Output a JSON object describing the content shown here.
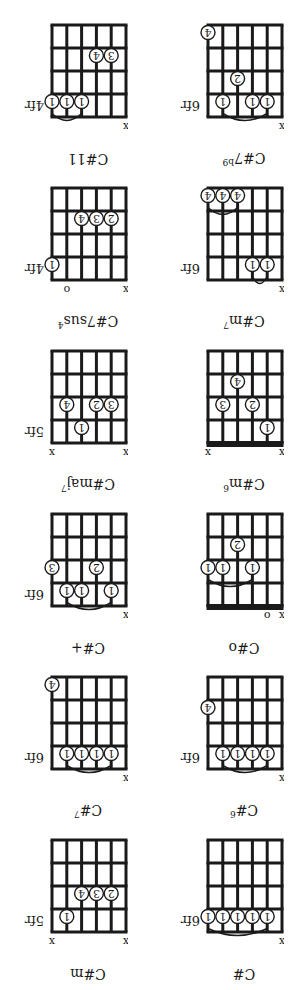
{
  "page": {
    "orientation": "rotated-180",
    "colors": {
      "ink": "#1a1a1a",
      "background": "#ffffff"
    }
  },
  "chords": [
    {
      "name": "C#",
      "suffix": "",
      "fret_label": "6fr",
      "nut": false,
      "markers": [
        "x",
        "",
        "",
        "",
        "",
        ""
      ],
      "dots": [
        {
          "s": 2,
          "f": 1,
          "finger": "1"
        },
        {
          "s": 3,
          "f": 1,
          "finger": "1"
        },
        {
          "s": 4,
          "f": 1,
          "finger": "1"
        },
        {
          "s": 5,
          "f": 1,
          "finger": "1"
        },
        {
          "s": 6,
          "f": 1,
          "finger": "1"
        }
      ],
      "barre": {
        "from": 2,
        "to": 6,
        "f": 1
      }
    },
    {
      "name": "C#m",
      "suffix": "",
      "fret_label": "5fr",
      "nut": false,
      "markers": [
        "x",
        "",
        "",
        "",
        "",
        "x"
      ],
      "dots": [
        {
          "s": 5,
          "f": 1,
          "finger": "1"
        },
        {
          "s": 2,
          "f": 2,
          "finger": "2"
        },
        {
          "s": 3,
          "f": 2,
          "finger": "3"
        },
        {
          "s": 4,
          "f": 2,
          "finger": "4"
        }
      ],
      "barre": null
    },
    {
      "name": "C#",
      "suffix": "6",
      "fret_label": "6fr",
      "nut": false,
      "markers": [
        "x",
        "",
        "",
        "",
        "",
        ""
      ],
      "dots": [
        {
          "s": 2,
          "f": 1,
          "finger": "1"
        },
        {
          "s": 3,
          "f": 1,
          "finger": "1"
        },
        {
          "s": 4,
          "f": 1,
          "finger": "1"
        },
        {
          "s": 5,
          "f": 1,
          "finger": "1"
        },
        {
          "s": 6,
          "f": 3,
          "finger": "4"
        }
      ],
      "barre": {
        "from": 2,
        "to": 5,
        "f": 1
      }
    },
    {
      "name": "C#",
      "suffix": "7",
      "fret_label": "6fr",
      "nut": false,
      "markers": [
        "x",
        "",
        "",
        "",
        "",
        ""
      ],
      "dots": [
        {
          "s": 2,
          "f": 1,
          "finger": "1"
        },
        {
          "s": 3,
          "f": 1,
          "finger": "1"
        },
        {
          "s": 4,
          "f": 1,
          "finger": "1"
        },
        {
          "s": 5,
          "f": 1,
          "finger": "1"
        },
        {
          "s": 6,
          "f": 4,
          "finger": "4"
        }
      ],
      "barre": {
        "from": 2,
        "to": 5,
        "f": 1
      }
    },
    {
      "name": "C#o",
      "suffix": "",
      "fret_label": "",
      "nut": true,
      "markers": [
        "x",
        "o",
        "",
        "",
        "",
        ""
      ],
      "dots": [
        {
          "s": 3,
          "f": 2,
          "finger": "1"
        },
        {
          "s": 5,
          "f": 2,
          "finger": "1"
        },
        {
          "s": 6,
          "f": 2,
          "finger": "1"
        },
        {
          "s": 4,
          "f": 3,
          "finger": "2"
        }
      ],
      "barre": {
        "from": 3,
        "to": 6,
        "f": 2
      }
    },
    {
      "name": "C#+",
      "suffix": "",
      "fret_label": "6fr",
      "nut": false,
      "markers": [
        "x",
        "",
        "",
        "",
        "",
        ""
      ],
      "dots": [
        {
          "s": 2,
          "f": 1,
          "finger": "1"
        },
        {
          "s": 4,
          "f": 1,
          "finger": "1"
        },
        {
          "s": 5,
          "f": 1,
          "finger": "1"
        },
        {
          "s": 3,
          "f": 2,
          "finger": "2"
        },
        {
          "s": 6,
          "f": 2,
          "finger": "3"
        }
      ],
      "barre": {
        "from": 2,
        "to": 5,
        "f": 1
      }
    },
    {
      "name": "C#m",
      "suffix": "6",
      "fret_label": "",
      "nut": true,
      "markers": [
        "x",
        "",
        "",
        "",
        "",
        "x"
      ],
      "dots": [
        {
          "s": 2,
          "f": 1,
          "finger": "1"
        },
        {
          "s": 3,
          "f": 2,
          "finger": "2"
        },
        {
          "s": 5,
          "f": 2,
          "finger": "3"
        },
        {
          "s": 4,
          "f": 3,
          "finger": "4"
        }
      ],
      "barre": null
    },
    {
      "name": "C#maj",
      "suffix": "7",
      "fret_label": "5fr",
      "nut": false,
      "markers": [
        "x",
        "",
        "",
        "",
        "",
        "x"
      ],
      "dots": [
        {
          "s": 4,
          "f": 1,
          "finger": "1"
        },
        {
          "s": 2,
          "f": 2,
          "finger": "3"
        },
        {
          "s": 3,
          "f": 2,
          "finger": "2"
        },
        {
          "s": 5,
          "f": 2,
          "finger": "4"
        }
      ],
      "barre": null
    },
    {
      "name": "C#m",
      "suffix": "7",
      "fret_label": "6fr",
      "nut": false,
      "markers": [
        "x",
        "",
        "",
        "",
        "",
        ""
      ],
      "dots": [
        {
          "s": 2,
          "f": 1,
          "finger": "1"
        },
        {
          "s": 3,
          "f": 1,
          "finger": "1"
        },
        {
          "s": 4,
          "f": 4,
          "finger": "4"
        },
        {
          "s": 5,
          "f": 4,
          "finger": "4"
        },
        {
          "s": 6,
          "f": 4,
          "finger": "4"
        }
      ],
      "barre": {
        "from": 2,
        "to": 3,
        "f": 1
      },
      "barre2": {
        "from": 4,
        "to": 6,
        "f": 4
      }
    },
    {
      "name": "C#7sus",
      "suffix": "4",
      "fret_label": "4fr",
      "nut": false,
      "markers": [
        "x",
        "",
        "",
        "",
        "o",
        ""
      ],
      "dots": [
        {
          "s": 6,
          "f": 1,
          "finger": "1"
        },
        {
          "s": 2,
          "f": 3,
          "finger": "2"
        },
        {
          "s": 3,
          "f": 3,
          "finger": "3"
        },
        {
          "s": 4,
          "f": 3,
          "finger": "4"
        }
      ],
      "barre": null
    },
    {
      "name": "C#7",
      "suffix": "b9",
      "fret_label": "6fr",
      "nut": false,
      "markers": [
        "x",
        "",
        "",
        "",
        "",
        ""
      ],
      "dots": [
        {
          "s": 2,
          "f": 1,
          "finger": "1"
        },
        {
          "s": 3,
          "f": 1,
          "finger": "1"
        },
        {
          "s": 5,
          "f": 1,
          "finger": "1"
        },
        {
          "s": 4,
          "f": 2,
          "finger": "2"
        },
        {
          "s": 6,
          "f": 4,
          "finger": "4"
        }
      ],
      "barre": {
        "from": 2,
        "to": 5,
        "f": 1
      }
    },
    {
      "name": "C#11",
      "suffix": "",
      "fret_label": "4fr",
      "nut": false,
      "markers": [
        "x",
        "",
        "",
        "",
        "",
        ""
      ],
      "dots": [
        {
          "s": 4,
          "f": 1,
          "finger": "1"
        },
        {
          "s": 5,
          "f": 1,
          "finger": "1"
        },
        {
          "s": 6,
          "f": 1,
          "finger": "1"
        },
        {
          "s": 2,
          "f": 3,
          "finger": "3"
        },
        {
          "s": 3,
          "f": 3,
          "finger": "4"
        }
      ],
      "barre": {
        "from": 4,
        "to": 6,
        "f": 1
      }
    }
  ]
}
